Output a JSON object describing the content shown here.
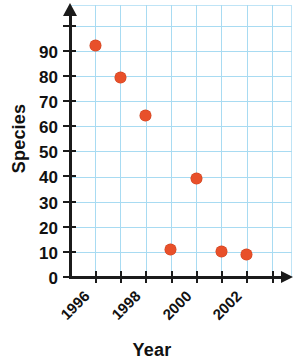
{
  "chart_data": {
    "type": "scatter",
    "title": "",
    "xlabel": "Year",
    "ylabel": "Species",
    "grid": true,
    "legend": "none",
    "xlim": [
      1995,
      2003
    ],
    "ylim": [
      0,
      100
    ],
    "x": [
      1996,
      1997,
      1998,
      1999,
      2000,
      2001,
      2002
    ],
    "values": [
      92,
      79,
      64,
      11,
      39,
      10,
      9
    ],
    "points": [
      {
        "x": 1996,
        "y": 92
      },
      {
        "x": 1997,
        "y": 79
      },
      {
        "x": 1998,
        "y": 64
      },
      {
        "x": 1999,
        "y": 11
      },
      {
        "x": 2000,
        "y": 39
      },
      {
        "x": 2001,
        "y": 10
      },
      {
        "x": 2002,
        "y": 9
      }
    ],
    "series": [
      {
        "name": "Species",
        "values": [
          92,
          79,
          64,
          11,
          39,
          10,
          9
        ]
      }
    ],
    "y_ticks": [
      0,
      10,
      20,
      30,
      40,
      50,
      60,
      70,
      80,
      90
    ],
    "x_ticks": [
      1996,
      1997,
      1998,
      1999,
      2000,
      2001,
      2002,
      2003
    ],
    "x_tick_labels": [
      "1996",
      "",
      "1998",
      "",
      "2000",
      "",
      "2002",
      ""
    ],
    "marker_color": "#e8502a",
    "grid_color": "#a8dbf2",
    "axis_color": "#1b1b1b"
  },
  "axis_titles": {
    "y": "Species",
    "x": "Year"
  },
  "y_tick_labels": {
    "t0": "0",
    "t10": "10",
    "t20": "20",
    "t30": "30",
    "t40": "40",
    "t50": "50",
    "t60": "60",
    "t70": "70",
    "t80": "80",
    "t90": "90"
  },
  "x_tick_labels": {
    "l1996": "1996",
    "l1998": "1998",
    "l2000": "2000",
    "l2002": "2002"
  }
}
